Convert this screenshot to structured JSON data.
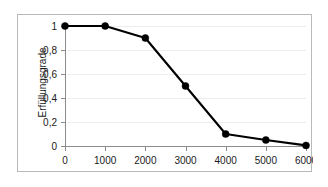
{
  "chart_data": {
    "type": "line",
    "title": "",
    "xlabel": "",
    "ylabel": "Erfüllungsgrade",
    "x": [
      0,
      1000,
      2000,
      3000,
      4000,
      5000,
      6000
    ],
    "values": [
      1,
      1,
      0.9,
      0.5,
      0.1,
      0.05,
      0.005
    ],
    "series": [
      {
        "name": "Erfüllungsgrad",
        "values": [
          1,
          1,
          0.9,
          0.5,
          0.1,
          0.05,
          0.005
        ],
        "color": "#000000",
        "marker": "circle"
      }
    ],
    "xlim": [
      0,
      6000
    ],
    "ylim": [
      0,
      1
    ],
    "x_tick_labels": [
      "0",
      "1000",
      "2000",
      "3000",
      "4000",
      "5000",
      "6000"
    ],
    "y_tick_values": [
      0,
      0.2,
      0.4,
      0.6,
      0.8,
      1
    ],
    "y_tick_labels": [
      "0",
      "0,2",
      "0,4",
      "0,6",
      "0,8",
      "1"
    ],
    "grid": "horizontal",
    "grid_color": "#ededed",
    "legend": "none",
    "legend_position": "none",
    "background_color": "#ffffff",
    "frame_color": "#b9b9b9",
    "axis_color": "#8c8c8c"
  }
}
